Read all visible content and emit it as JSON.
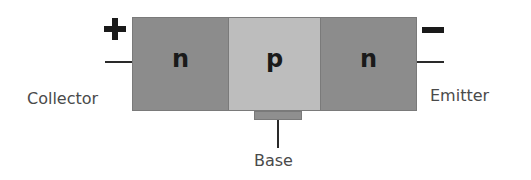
{
  "diagram": {
    "regions": [
      {
        "id": "collector-region",
        "label": "n",
        "color": "#8c8c8c"
      },
      {
        "id": "base-region",
        "label": "p",
        "color": "#bdbdbd"
      },
      {
        "id": "emitter-region",
        "label": "n",
        "color": "#8c8c8c"
      }
    ],
    "terminals": {
      "collector": {
        "label": "Collector",
        "polarity": "+"
      },
      "base": {
        "label": "Base"
      },
      "emitter": {
        "label": "Emitter",
        "polarity": "−"
      }
    },
    "colors": {
      "n_region": "#8c8c8c",
      "p_region": "#bdbdbd",
      "base_tab": "#8f8f8f",
      "lines": "#2a2a2a",
      "text": "#4a4a4a"
    }
  }
}
